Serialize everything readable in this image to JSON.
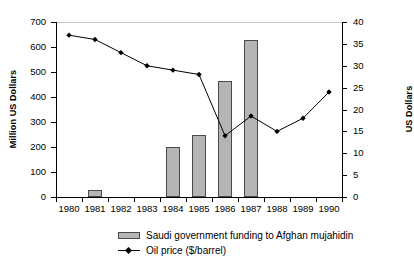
{
  "chart_data": {
    "type": "bar",
    "title": "",
    "subtitle": "",
    "xlabel": "",
    "ylabel": "Million US Dollars",
    "y2label": "US Dollars",
    "grid": false,
    "legend_position": "bottom-left",
    "categories": [
      "1980",
      "1981",
      "1982",
      "1983",
      "1984",
      "1985",
      "1986",
      "1987",
      "1988",
      "1989",
      "1990"
    ],
    "ylim": [
      0,
      700
    ],
    "yticks": [
      0,
      100,
      200,
      300,
      400,
      500,
      600,
      700
    ],
    "y2lim": [
      0,
      40
    ],
    "y2ticks": [
      0,
      5,
      10,
      15,
      20,
      25,
      30,
      35,
      40
    ],
    "series": [
      {
        "name": "Saudi government funding to Afghan mujahidin",
        "type": "bar",
        "axis": "left",
        "unit": "Million US Dollars",
        "color": "#b5b5b5",
        "edge_color": "#4a4a4a",
        "values": [
          0,
          30,
          0,
          0,
          200,
          250,
          465,
          627,
          0,
          0,
          0
        ]
      },
      {
        "name": "Oil price ($/barrel)",
        "type": "line",
        "axis": "right",
        "unit": "US Dollars",
        "color": "#000000",
        "marker": "diamond",
        "values": [
          37.0,
          36.0,
          33.0,
          30.0,
          29.0,
          28.0,
          14.0,
          18.5,
          15.0,
          18.0,
          24.0
        ]
      }
    ]
  },
  "legend": {
    "items": [
      {
        "label": "Saudi government funding to Afghan mujahidin",
        "swatch": "bar-swatch"
      },
      {
        "label": "Oil price ($/barrel)",
        "swatch": "line-swatch"
      }
    ]
  },
  "axes": {
    "left_title": "Million US Dollars",
    "right_title": "US Dollars",
    "left_ticks": [
      "0",
      "100",
      "200",
      "300",
      "400",
      "500",
      "600",
      "700"
    ],
    "right_ticks": [
      "0",
      "5",
      "10",
      "15",
      "20",
      "25",
      "30",
      "35",
      "40"
    ],
    "x_ticks": [
      "1980",
      "1981",
      "1982",
      "1983",
      "1984",
      "1985",
      "1986",
      "1987",
      "1988",
      "1989",
      "1990"
    ]
  }
}
